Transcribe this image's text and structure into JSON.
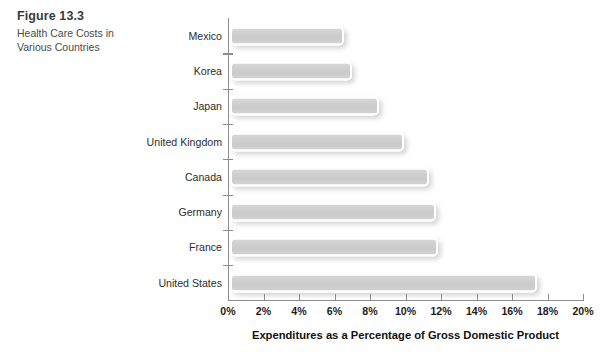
{
  "figure": {
    "number": "Figure 13.3",
    "title": "Health Care Costs in Various Countries"
  },
  "chart_data": {
    "type": "bar",
    "orientation": "horizontal",
    "title": "Health Care Costs in Various Countries",
    "xlabel": "Expenditures as a Percentage of Gross Domestic Product",
    "ylabel": "",
    "xlim": [
      0,
      20
    ],
    "grid": false,
    "legend": null,
    "categories": [
      "Mexico",
      "Korea",
      "Japan",
      "United Kingdom",
      "Canada",
      "Germany",
      "France",
      "United States"
    ],
    "values": [
      6.4,
      6.9,
      8.4,
      9.8,
      11.2,
      11.6,
      11.7,
      17.3
    ],
    "xticks": [
      0,
      2,
      4,
      6,
      8,
      10,
      12,
      14,
      16,
      18,
      20
    ],
    "xtick_labels": [
      "0%",
      "2%",
      "4%",
      "6%",
      "8%",
      "10%",
      "12%",
      "14%",
      "16%",
      "18%",
      "20%"
    ],
    "bar_color": "#d0d0d0",
    "bar_border_color": "#ffffff",
    "axis_color": "#8c8c8c",
    "background": "#ffffff"
  }
}
